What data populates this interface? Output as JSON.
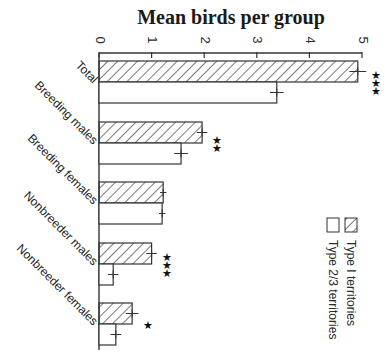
{
  "chart_data": {
    "type": "bar",
    "orientation": "horizontal",
    "title": "Mean birds per group",
    "xlabel": "",
    "ylabel": "",
    "xlim": [
      0,
      5
    ],
    "ticks": [
      0,
      1,
      2,
      3,
      4,
      5
    ],
    "categories": [
      "Total",
      "Breeding males",
      "Breeding females",
      "Nonbreeder males",
      "Nonbreeder females"
    ],
    "series": [
      {
        "name": "Type 1 territories",
        "pattern": "hatched",
        "values": [
          4.92,
          1.96,
          1.22,
          1.0,
          0.63
        ],
        "errors": [
          0.16,
          0.1,
          0.06,
          0.1,
          0.12
        ]
      },
      {
        "name": "Type 2/3 territories",
        "pattern": "open",
        "values": [
          3.38,
          1.56,
          1.2,
          0.27,
          0.32
        ],
        "errors": [
          0.13,
          0.13,
          0.06,
          0.1,
          0.1
        ]
      }
    ],
    "significance": [
      "***",
      "**",
      "",
      "***",
      "*"
    ],
    "legend_position": "right, rotated",
    "grid": false
  },
  "title": "Mean birds per group",
  "legend": {
    "type1": "Type I territories",
    "type23": "Type 2/3 territories"
  }
}
